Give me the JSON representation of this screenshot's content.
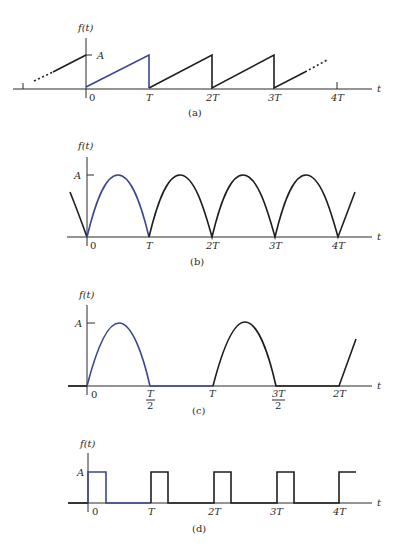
{
  "figure": {
    "panels": [
      {
        "id": "a",
        "caption": "(a)",
        "waveform": "sawtooth",
        "y_label": "f(t)",
        "amplitude_label": "A",
        "x_label": "t",
        "x_ticks": [
          "0",
          "T",
          "2T",
          "3T",
          "4T"
        ]
      },
      {
        "id": "b",
        "caption": "(b)",
        "waveform": "full-wave rectified sine",
        "y_label": "f(t)",
        "amplitude_label": "A",
        "x_label": "t",
        "x_ticks": [
          "0",
          "T",
          "2T",
          "3T",
          "4T"
        ]
      },
      {
        "id": "c",
        "caption": "(c)",
        "waveform": "half-wave rectified sine",
        "y_label": "f(t)",
        "amplitude_label": "A",
        "x_label": "t",
        "x_ticks": [
          "0",
          "T/2",
          "T",
          "3T/2",
          "2T"
        ],
        "fraction_ticks": {
          "t_half": {
            "num": "T",
            "den": "2"
          },
          "three_t_half": {
            "num": "3T",
            "den": "2"
          }
        }
      },
      {
        "id": "d",
        "caption": "(d)",
        "waveform": "rectangular pulse train",
        "y_label": "f(t)",
        "amplitude_label": "A",
        "x_label": "t",
        "x_ticks": [
          "0",
          "T",
          "2T",
          "3T",
          "4T"
        ]
      }
    ],
    "colors": {
      "highlight_period": "#3a4690",
      "waveform": "#1e1e1e",
      "axis": "#2b2b2b"
    }
  }
}
